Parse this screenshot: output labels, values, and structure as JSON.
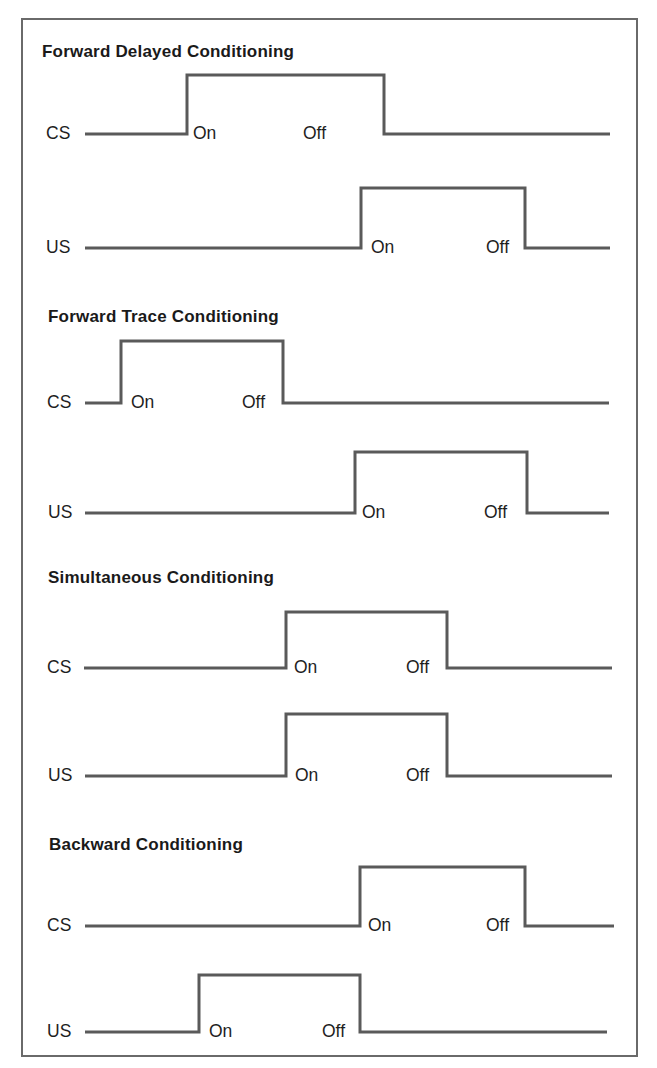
{
  "style": {
    "line_color": "#5a5a5a",
    "line_width": 3,
    "border_color": "#6a6a6a",
    "text_color": "#1e1e1e"
  },
  "sections": [
    {
      "title": "Forward Delayed Conditioning",
      "title_x": 42,
      "title_y": 42,
      "rows": [
        {
          "label": "CS",
          "label_x": 46,
          "start_x": 85,
          "end_x": 610,
          "base_y": 134,
          "top_y": 75,
          "rise_x": 187,
          "fall_x": 384,
          "on_label": "On",
          "on_x": 193,
          "off_label": "Off",
          "off_x": 303
        },
        {
          "label": "US",
          "label_x": 46,
          "start_x": 85,
          "end_x": 610,
          "base_y": 248,
          "top_y": 188,
          "rise_x": 361,
          "fall_x": 525,
          "on_label": "On",
          "on_x": 371,
          "off_label": "Off",
          "off_x": 486
        }
      ]
    },
    {
      "title": "Forward Trace Conditioning",
      "title_x": 48,
      "title_y": 307,
      "rows": [
        {
          "label": "CS",
          "label_x": 47,
          "start_x": 85,
          "end_x": 609,
          "base_y": 403,
          "top_y": 341,
          "rise_x": 121,
          "fall_x": 283,
          "on_label": "On",
          "on_x": 131,
          "off_label": "Off",
          "off_x": 242
        },
        {
          "label": "US",
          "label_x": 48,
          "start_x": 85,
          "end_x": 609,
          "base_y": 513,
          "top_y": 452,
          "rise_x": 355,
          "fall_x": 527,
          "on_label": "On",
          "on_x": 362,
          "off_label": "Off",
          "off_x": 484
        }
      ]
    },
    {
      "title": "Simultaneous Conditioning",
      "title_x": 48,
      "title_y": 568,
      "rows": [
        {
          "label": "CS",
          "label_x": 47,
          "start_x": 84,
          "end_x": 612,
          "base_y": 668,
          "top_y": 612,
          "rise_x": 286,
          "fall_x": 447,
          "on_label": "On",
          "on_x": 294,
          "off_label": "Off",
          "off_x": 406
        },
        {
          "label": "US",
          "label_x": 48,
          "start_x": 85,
          "end_x": 612,
          "base_y": 776,
          "top_y": 714,
          "rise_x": 286,
          "fall_x": 447,
          "on_label": "On",
          "on_x": 295,
          "off_label": "Off",
          "off_x": 406
        }
      ]
    },
    {
      "title": "Backward Conditioning",
      "title_x": 49,
      "title_y": 835,
      "rows": [
        {
          "label": "CS",
          "label_x": 47,
          "start_x": 85,
          "end_x": 614,
          "base_y": 926,
          "top_y": 867,
          "rise_x": 360,
          "fall_x": 525,
          "on_label": "On",
          "on_x": 368,
          "off_label": "Off",
          "off_x": 486
        },
        {
          "label": "US",
          "label_x": 47,
          "start_x": 85,
          "end_x": 607,
          "base_y": 1032,
          "top_y": 975,
          "rise_x": 199,
          "fall_x": 360,
          "on_label": "On",
          "on_x": 209,
          "off_label": "Off",
          "off_x": 322
        }
      ]
    }
  ]
}
